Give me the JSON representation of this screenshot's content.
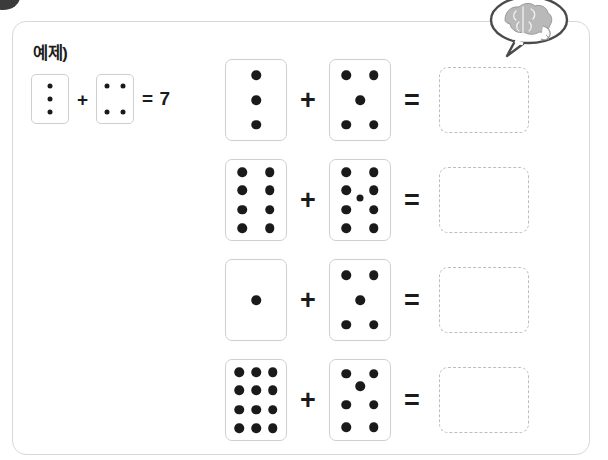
{
  "worksheet": {
    "example": {
      "label": "예제)",
      "left_card": {
        "value": 3,
        "layout": "col-3"
      },
      "plus": "+",
      "right_card": {
        "value": 4,
        "layout": "corners-4"
      },
      "result_text": "= 7",
      "equals": "=",
      "sum": 7
    },
    "operators": {
      "plus": "+",
      "equals": "="
    },
    "answer_placeholder": "",
    "problems": [
      {
        "index": 1,
        "left_card": {
          "value": 3,
          "layout": "col-3"
        },
        "right_card": {
          "value": 5,
          "layout": "five"
        },
        "answer": ""
      },
      {
        "index": 2,
        "left_card": {
          "value": 8,
          "layout": "grid-2x4"
        },
        "right_card": {
          "value": 9,
          "layout": "grid-2x4-center"
        },
        "answer": ""
      },
      {
        "index": 3,
        "left_card": {
          "value": 1,
          "layout": "one"
        },
        "right_card": {
          "value": 5,
          "layout": "five"
        },
        "answer": ""
      },
      {
        "index": 4,
        "left_card": {
          "value": 12,
          "layout": "grid-3x4"
        },
        "right_card": {
          "value": 7,
          "layout": "grid-2x3-upper-center"
        },
        "answer": ""
      }
    ]
  },
  "decorations": {
    "corner_bullet": "bullet-circle",
    "thought_bubble": "brain-thought-bubble-icon"
  },
  "colors": {
    "dot": "#1a1a1a",
    "card_border": "#cfcfcf",
    "panel_border": "#d8d8d8",
    "answer_border": "#bdbdbd",
    "text": "#1c1c1c",
    "brain_fill": "#b9b9b9",
    "bubble_stroke": "#4a4a4a"
  }
}
